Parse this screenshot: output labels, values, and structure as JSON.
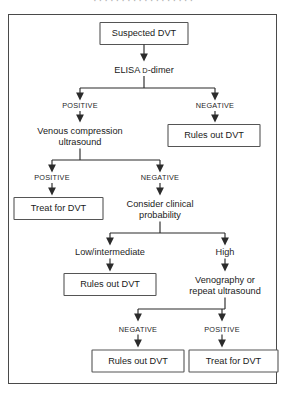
{
  "figure": {
    "caption_fragment": "· · · · ·   · · · ·   · · · · · · · · ·",
    "accent_line": "#2b2b2b",
    "accent_box_stroke": "#555555",
    "frame_stroke": "#4a4a4a",
    "background": "#ffffff"
  },
  "nodes": {
    "suspected_dvt": "Suspected DVT",
    "elisa_prefix": "ELISA ",
    "elisa_d": "D",
    "elisa_suffix": "-dimer",
    "venous_compression_line1": "Venous compression",
    "venous_compression_line2": "ultrasound",
    "rules_out_dvt_1": "Rules out DVT",
    "treat_for_dvt_1": "Treat for DVT",
    "consider_clinical_line1": "Consider clinical",
    "consider_clinical_line2": "probability",
    "rules_out_dvt_2": "Rules out DVT",
    "venography_line1": "Venography or",
    "venography_line2": "repeat ultrasound",
    "rules_out_dvt_3": "Rules out DVT",
    "treat_for_dvt_2": "Treat for DVT"
  },
  "branch_labels": {
    "elisa_positive": "POSITIVE",
    "elisa_negative": "NEGATIVE",
    "ultrasound_positive": "POSITIVE",
    "ultrasound_negative": "NEGATIVE",
    "probability_low": "Low/intermediate",
    "probability_high": "High",
    "venography_negative": "NEGATIVE",
    "venography_positive": "POSITIVE"
  }
}
